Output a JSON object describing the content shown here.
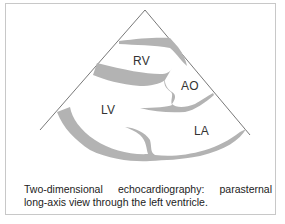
{
  "figure": {
    "labels": {
      "rv": "RV",
      "ao": "AO",
      "lv": "LV",
      "la": "LA"
    },
    "caption": {
      "line1_words": [
        "Two-dimensional",
        "echocardiography:",
        "parasternal"
      ],
      "line2": "long-axis view through the left ventricle."
    },
    "colors": {
      "wall": "#b3b3b3",
      "outline": "#555555",
      "border": "#c8c8c8"
    }
  }
}
